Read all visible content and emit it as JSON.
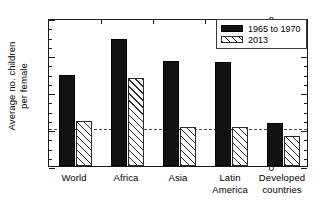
{
  "chart_data": {
    "type": "bar",
    "title": "",
    "subtitle": "",
    "xlabel": "",
    "ylabel": "Average no. children per female",
    "ylabel_line1": "Average no. children",
    "ylabel_line2": "per female",
    "categories": [
      "World",
      "Africa",
      "Asia",
      "Latin America",
      "Developed countries"
    ],
    "category_lines": [
      [
        "World",
        ""
      ],
      [
        "Africa",
        ""
      ],
      [
        "Asia",
        ""
      ],
      [
        "Latin",
        "America"
      ],
      [
        "Developed",
        "countries"
      ]
    ],
    "series": [
      {
        "name": "1965 to 1970",
        "style": "solid-black",
        "values": [
          4.9,
          6.85,
          5.65,
          5.6,
          2.35
        ]
      },
      {
        "name": "2013",
        "style": "hatched",
        "values": [
          2.45,
          4.75,
          2.1,
          2.1,
          1.6
        ]
      }
    ],
    "ylim": [
      0,
      8
    ],
    "ytick_labels": [
      "0",
      "2",
      "4",
      "6",
      "8"
    ],
    "ytick_values": [
      0,
      2,
      4,
      6,
      8
    ],
    "yminor_step": 0.5,
    "grid": false,
    "legend_position": "top-right",
    "annotations": [
      {
        "type": "reference-line",
        "style": "dashed",
        "value": 2.1,
        "label": ""
      }
    ],
    "colors": {
      "series1": "#111111",
      "series2": "#ffffff",
      "hatch": "#2b2b2b",
      "axis": "#1a1a1a",
      "refline": "#4c4c4c",
      "background": "#ffffff"
    }
  },
  "legend": {
    "items": [
      {
        "label": "1965 to 1970",
        "style": "solid"
      },
      {
        "label": "2013",
        "style": "hatch"
      }
    ]
  }
}
